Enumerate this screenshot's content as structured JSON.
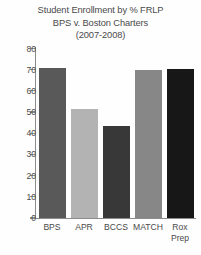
{
  "chart_data": {
    "type": "bar",
    "title": "Student Enrollment by % FRLP BPS v. Boston Charters (2007-2008)",
    "title_lines": [
      "Student Enrollment by % FRLP",
      "BPS v. Boston Charters",
      "(2007-2008)"
    ],
    "categories": [
      "BPS",
      "APR",
      "BCCS",
      "MATCH",
      "Rox Prep"
    ],
    "category_lines": [
      [
        "BPS"
      ],
      [
        "APR"
      ],
      [
        "BCCS"
      ],
      [
        "MATCH"
      ],
      [
        "Rox",
        "Prep"
      ]
    ],
    "values": [
      71,
      51.5,
      43.5,
      70,
      70.5
    ],
    "xlabel": "",
    "ylabel": "",
    "ylim": [
      0,
      80
    ],
    "yticks": [
      0,
      10,
      20,
      30,
      40,
      50,
      60,
      70,
      80
    ],
    "ytick_labels": [
      "0",
      "10",
      "20",
      "30",
      "40",
      "50",
      "60",
      "70",
      "80"
    ],
    "grid": false,
    "legend": false,
    "bar_colors": [
      "#595959",
      "#b3b3b3",
      "#383838",
      "#878787",
      "#171717"
    ],
    "axis_color": "#8c8c8c",
    "background_color": "#fefefe",
    "text_color": "#4a4a4a"
  }
}
